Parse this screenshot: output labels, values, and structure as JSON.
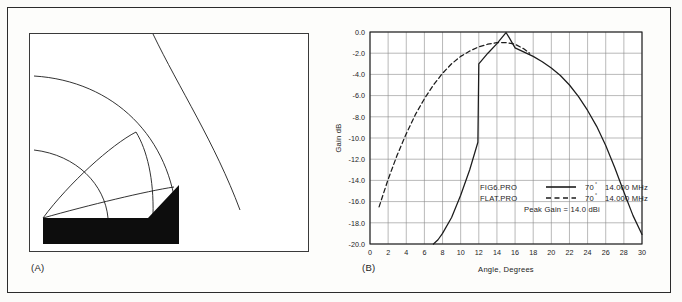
{
  "figure": {
    "panel_a": {
      "caption": "(A)",
      "description": "terrain-profile-diagram"
    },
    "panel_b": {
      "caption": "(B)"
    }
  },
  "chart_data": {
    "type": "line",
    "title": "",
    "xlabel": "Angle, Degrees",
    "ylabel": "Gain dB",
    "xlim": [
      0,
      30
    ],
    "ylim": [
      -20.0,
      0.0
    ],
    "xticks": [
      0,
      2,
      4,
      6,
      8,
      10,
      12,
      14,
      16,
      18,
      20,
      22,
      24,
      26,
      28,
      30
    ],
    "xtick_labels": [
      "0",
      "2",
      "4",
      "6",
      "8",
      "10",
      "12",
      "14",
      "16",
      "18",
      "20",
      "22",
      "24",
      "26",
      "28",
      "30"
    ],
    "yticks": [
      0.0,
      -2.0,
      -4.0,
      -6.0,
      -8.0,
      -10.0,
      -12.0,
      -14.0,
      -16.0,
      -18.0,
      -20.0
    ],
    "ytick_labels": [
      "0.0",
      "-2.0",
      "-4.0",
      "-6.0",
      "-8.0",
      "-10.0",
      "-12.0",
      "-14.0",
      "-16.0",
      "-18.0",
      "-20.0"
    ],
    "grid": true,
    "legend_position": "center-right",
    "series": [
      {
        "name": "FIG6.PRO",
        "style": "solid",
        "color": "#1c1c1c",
        "elevation": "70",
        "degree_symbol": "°",
        "frequency": "14.000 MHz",
        "x": [
          7.0,
          7.5,
          8.0,
          9.0,
          10.0,
          11.0,
          11.9,
          12.0,
          13.0,
          14.0,
          15.0,
          15.4,
          16.0,
          17.0,
          18.0,
          19.0,
          20.0,
          21.0,
          22.0,
          23.0,
          24.0,
          25.0,
          26.0,
          27.0,
          28.0,
          29.0,
          30.0
        ],
        "y": [
          -20.0,
          -19.6,
          -19.0,
          -17.5,
          -15.4,
          -13.0,
          -10.4,
          -3.0,
          -2.0,
          -1.1,
          -0.05,
          -0.6,
          -1.5,
          -1.9,
          -2.3,
          -2.8,
          -3.4,
          -4.1,
          -5.0,
          -6.1,
          -7.4,
          -8.9,
          -10.7,
          -12.8,
          -15.1,
          -17.3,
          -19.1
        ]
      },
      {
        "name": "FLAT.PRO",
        "style": "dashed",
        "color": "#1c1c1c",
        "elevation": "70",
        "degree_symbol": "°",
        "frequency": "14.000 MHz",
        "x": [
          1.0,
          2.0,
          3.0,
          4.0,
          5.0,
          6.0,
          7.0,
          8.0,
          9.0,
          10.0,
          11.0,
          12.0,
          13.0,
          14.0,
          15.0,
          16.0,
          17.0,
          17.6
        ],
        "y": [
          -16.5,
          -13.9,
          -11.6,
          -9.6,
          -7.8,
          -6.3,
          -5.0,
          -3.9,
          -3.0,
          -2.3,
          -1.8,
          -1.4,
          -1.15,
          -1.0,
          -1.0,
          -1.15,
          -1.6,
          -2.0
        ]
      }
    ],
    "annotations": [
      "Peak Gain = 14.0 dBi"
    ],
    "legend": [
      {
        "label": "FIG6.PRO",
        "style": "solid",
        "angle": "70",
        "degree": "°",
        "freq": "14.000 MHz"
      },
      {
        "label": "FLAT.PRO",
        "style": "dashed",
        "angle": "70",
        "degree": "°",
        "freq": "14.000 MHz"
      }
    ],
    "peak_gain_text": "Peak Gain = 14.0 dBi"
  },
  "colors": {
    "frame": "#2b2b2b",
    "grid": "#8a8a8a",
    "axis": "#1c1c1c",
    "curve": "#1c1c1c",
    "terrain_fill": "#0d0d0d",
    "page_background": "#fbfbf9",
    "panel_background": "#ffffff"
  }
}
